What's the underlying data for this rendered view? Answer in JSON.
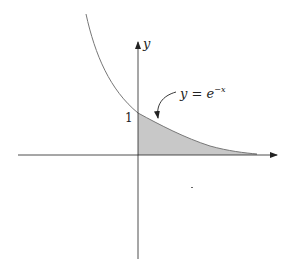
{
  "figure": {
    "axis_labels": {
      "y": "y"
    },
    "tick_labels": {
      "y_one": "1"
    },
    "curve_label": {
      "lhs": "y = e",
      "exponent": "−x"
    },
    "colors": {
      "shade": "#c8c8c8",
      "curve": "#777777",
      "axis": "#222222"
    }
  }
}
